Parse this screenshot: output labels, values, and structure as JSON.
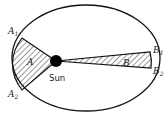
{
  "diagram": {
    "orbit": {
      "cx": 86,
      "cy": 58,
      "rx": 74,
      "ry": 53,
      "stroke": "#111111"
    },
    "sun": {
      "x": 56,
      "y": 61,
      "r": 6,
      "label": "Sun",
      "color": "#000000"
    },
    "points": {
      "A1": {
        "x": 22,
        "y": 38,
        "label": "A",
        "sub": "1"
      },
      "A2": {
        "x": 22,
        "y": 90,
        "label": "A",
        "sub": "2"
      },
      "B1": {
        "x": 150,
        "y": 52,
        "label": "B",
        "sub": "1"
      },
      "B2": {
        "x": 151,
        "y": 68,
        "label": "B",
        "sub": "2"
      }
    },
    "regions": [
      {
        "id": "A",
        "label": "A",
        "fill": "hatched"
      },
      {
        "id": "B",
        "label": "B",
        "fill": "hatched"
      }
    ]
  }
}
